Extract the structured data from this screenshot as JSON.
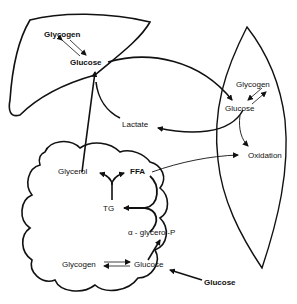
{
  "diagram": {
    "organs": [
      "liver",
      "muscle",
      "adipose-tissue"
    ],
    "labels": {
      "liver_glycogen": "Glycogen",
      "liver_glucose": "Glucose",
      "muscle_glycogen": "Glycogen",
      "muscle_glucose": "Glucose",
      "lactate": "Lactate",
      "oxidation": "Oxidation",
      "glycerol": "Glycerol",
      "ffa": "FFA",
      "tg": "TG",
      "alpha_glycerol_p": "α - glycerol-P",
      "adipose_glycogen": "Glycogen",
      "adipose_glucose": "Glucose",
      "blood_glucose": "Glucose"
    },
    "edges": [
      {
        "from": "Glycogen (liver)",
        "to": "Glucose (liver)",
        "type": "reversible"
      },
      {
        "from": "Glucose (liver)",
        "to": "Glucose (muscle)"
      },
      {
        "from": "Glycogen (muscle)",
        "to": "Glucose (muscle)",
        "type": "reversible"
      },
      {
        "from": "Glucose (muscle)",
        "to": "Lactate"
      },
      {
        "from": "Glucose (muscle)",
        "to": "Oxidation"
      },
      {
        "from": "Lactate",
        "to": "Glucose (liver)"
      },
      {
        "from": "Glycerol",
        "to": "Glucose (liver)"
      },
      {
        "from": "FFA",
        "to": "Oxidation"
      },
      {
        "from": "TG",
        "to": "Glycerol"
      },
      {
        "from": "TG",
        "to": "FFA"
      },
      {
        "from": "FFA",
        "to": "TG"
      },
      {
        "from": "α-glycerol-P",
        "to": "TG"
      },
      {
        "from": "Glucose (adipose)",
        "to": "α-glycerol-P"
      },
      {
        "from": "Glycogen (adipose)",
        "to": "Glucose (adipose)",
        "type": "reversible"
      },
      {
        "from": "Glucose (blood)",
        "to": "Glucose (adipose)"
      }
    ]
  }
}
